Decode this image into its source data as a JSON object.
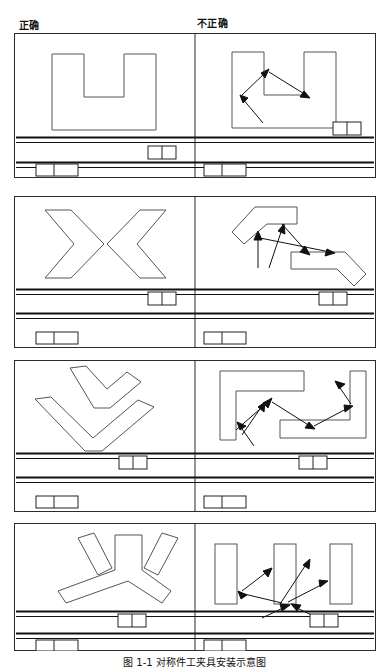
{
  "figure": {
    "caption": "图 1-1  对称件工夹具安装示意图",
    "columns": {
      "correct_label": "正确",
      "incorrect_label": "不正确"
    },
    "stroke_color": "#3a3a3a",
    "rail_color": "#111111",
    "border_color": "#2b2b2b",
    "arrow_color": "#111111"
  },
  "panels": [
    {
      "id": "panel-1",
      "name": "u-channel-nesting",
      "correct": {
        "shape_name": "u-shaped-part",
        "description": "单个U形件居中排布",
        "parts_count": 1
      },
      "incorrect": {
        "shape_name": "u-shaped-part",
        "description": "U形件带冲击受力箭头",
        "parts_count": 1,
        "arrows_count": 3
      },
      "rail": {
        "upper_block_x_correct": 152,
        "upper_block_x_incorrect": 337,
        "lower_block_x_correct": 27,
        "lower_block_x_incorrect": 195
      }
    },
    {
      "id": "panel-2",
      "name": "chevron-nesting",
      "correct": {
        "shape_name": "chevron-pair",
        "description": "两个V形件对向嵌套排布",
        "parts_count": 2
      },
      "incorrect": {
        "shape_name": "angled-bar-pair",
        "description": "两个斜置折弯件并带受力箭头",
        "parts_count": 2,
        "arrows_count": 4
      },
      "rail": {
        "upper_block_x_correct": 152,
        "upper_block_x_incorrect": 321,
        "lower_block_x_correct": 27,
        "lower_block_x_incorrect": 195
      }
    },
    {
      "id": "panel-3",
      "name": "boomerang-nesting",
      "correct": {
        "shape_name": "boomerang-pair",
        "description": "两个弯折件上下嵌套排布",
        "parts_count": 2
      },
      "incorrect": {
        "shape_name": "bracket-pair",
        "description": "两个L形支架件并带受力箭头",
        "parts_count": 2,
        "arrows_count": 6
      },
      "rail": {
        "upper_block_x_correct": 120,
        "upper_block_x_incorrect": 300,
        "lower_block_x_correct": 27,
        "lower_block_x_incorrect": 195
      }
    },
    {
      "id": "panel-4",
      "name": "tripod-nesting",
      "correct": {
        "shape_name": "tripod-part",
        "description": "Y形三叉件与两条斜杆排布",
        "parts_count": 3
      },
      "incorrect": {
        "shape_name": "vertical-bar-triple",
        "description": "三条竖直条料并带交叉受力箭头",
        "parts_count": 3,
        "arrows_count": 6
      },
      "rail": {
        "upper_block_x_correct": 118,
        "upper_block_x_incorrect": 310,
        "lower_block_x_correct": 27,
        "lower_block_x_incorrect": 195
      }
    }
  ]
}
